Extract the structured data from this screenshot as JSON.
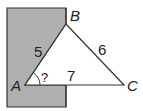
{
  "diagram": {
    "points": {
      "A": {
        "label": "A",
        "x": 25,
        "y": 85
      },
      "B": {
        "label": "B",
        "x": 66,
        "y": 24
      },
      "C": {
        "label": "C",
        "x": 124,
        "y": 85
      }
    },
    "sides": {
      "AB": "5",
      "BC": "6",
      "AC": "7"
    },
    "angle_A_label": "?",
    "wall_color": "#b0b0b0",
    "line_color": "#333333"
  }
}
